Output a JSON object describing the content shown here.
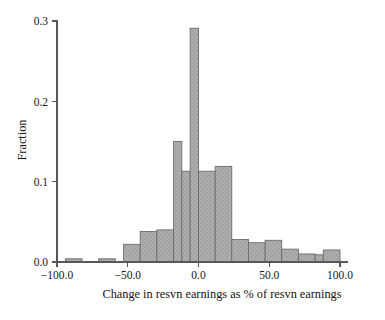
{
  "chart_data": {
    "type": "bar",
    "title": "",
    "subtitle": "",
    "xlabel": "Change in resvn earnings as % of resvn earnings",
    "ylabel": "Fraction",
    "xlim": [
      -100,
      100
    ],
    "ylim": [
      0.0,
      0.3
    ],
    "grid": false,
    "legend": false,
    "legend_position": "none",
    "bin_width": 11.8,
    "xticks": [
      -100,
      -50,
      0,
      50,
      100
    ],
    "xtick_labels": [
      "-100.0",
      "-50.0",
      "0.0",
      "50.0",
      "100.0"
    ],
    "yticks": [
      0.0,
      0.1,
      0.2,
      0.3
    ],
    "ytick_labels": [
      "0.0",
      "0.1",
      "0.2",
      "0.3"
    ],
    "bar_fill_color": "#a9a9a9",
    "bar_edge_color": "#6d6d6d",
    "axis_color": "#585858",
    "bins": [
      {
        "x0": -94.1,
        "x1": -82.3,
        "value": 0.004
      },
      {
        "x0": -70.6,
        "x1": -58.8,
        "value": 0.004
      },
      {
        "x0": -52.9,
        "x1": -41.2,
        "value": 0.022
      },
      {
        "x0": -41.2,
        "x1": -29.4,
        "value": 0.038
      },
      {
        "x0": -29.4,
        "x1": -17.6,
        "value": 0.04
      },
      {
        "x0": -17.6,
        "x1": -11.8,
        "value": 0.15
      },
      {
        "x0": -11.8,
        "x1": -5.9,
        "value": 0.113
      },
      {
        "x0": -5.9,
        "x1": 0.0,
        "value": 0.291
      },
      {
        "x0": 0.0,
        "x1": 11.8,
        "value": 0.113
      },
      {
        "x0": 11.8,
        "x1": 23.5,
        "value": 0.119
      },
      {
        "x0": 23.5,
        "x1": 35.3,
        "value": 0.028
      },
      {
        "x0": 35.3,
        "x1": 47.1,
        "value": 0.024
      },
      {
        "x0": 47.1,
        "x1": 58.8,
        "value": 0.027
      },
      {
        "x0": 58.8,
        "x1": 70.6,
        "value": 0.016
      },
      {
        "x0": 70.6,
        "x1": 82.4,
        "value": 0.01
      },
      {
        "x0": 82.4,
        "x1": 88.2,
        "value": 0.009
      },
      {
        "x0": 88.2,
        "x1": 100.0,
        "value": 0.015
      }
    ],
    "categories": [
      "-88.2",
      "-64.7",
      "-47.1",
      "-35.3",
      "-23.5",
      "-14.7",
      "-8.8",
      "-2.9",
      "5.9",
      "17.6",
      "29.4",
      "41.2",
      "52.9",
      "64.7",
      "76.5",
      "85.3",
      "94.1"
    ],
    "values": [
      0.004,
      0.004,
      0.022,
      0.038,
      0.04,
      0.15,
      0.113,
      0.291,
      0.113,
      0.119,
      0.028,
      0.024,
      0.027,
      0.016,
      0.01,
      0.009,
      0.015
    ]
  }
}
